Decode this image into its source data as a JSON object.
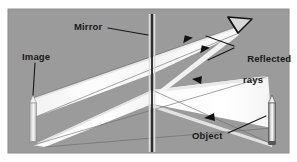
{
  "figure": {
    "kind": "optics-ray-diagram",
    "background_color": "#9b9b9b",
    "page_color": "#ffffff",
    "beam_color": "#fbfbfb",
    "beam_shadow_color": "#cfcfcf",
    "ink_color": "#1a1a1a"
  },
  "labels": {
    "mirror": "Mirror",
    "image": "Image",
    "reflected_line1": "Reflected",
    "reflected_line2": "rays",
    "object": "Object"
  },
  "elements": {
    "mirror_line": "vertical-double-line",
    "object_icon": "pencil-upright",
    "image_icon": "pencil-upright-virtual",
    "eye_icon": "viewer-eye-wedge",
    "ray_arrow": "arrowhead"
  },
  "geometry": {
    "mirror_x": 152,
    "mirror_top_y": 14,
    "mirror_bottom_y": 152,
    "object_x": 272,
    "object_top_y": 95,
    "object_bottom_y": 146,
    "image_x": 33,
    "image_top_y": 95,
    "image_bottom_y": 146,
    "eye_x": 241,
    "eye_y": 24,
    "arrow_count": 4
  }
}
